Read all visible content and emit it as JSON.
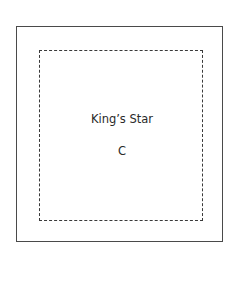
{
  "diagram": {
    "outer_border_style": "solid",
    "inner_border_style": "dashed",
    "title": "King’s Star",
    "label": "C"
  }
}
